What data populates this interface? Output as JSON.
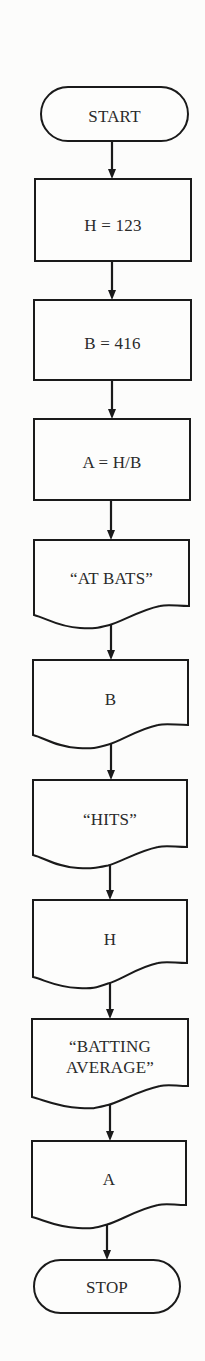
{
  "diagram": {
    "type": "flowchart",
    "direction": "top-to-bottom",
    "colors": {
      "background": "#fcfcfb",
      "stroke": "#1a1a1a",
      "text": "#2a2a2a"
    },
    "nodes": [
      {
        "id": "start",
        "kind": "terminal",
        "label_lines": [
          "START"
        ],
        "box": {
          "x": 41,
          "y": 87,
          "w": 147,
          "h": 54
        },
        "text_y": [
          122
        ]
      },
      {
        "id": "assign-h",
        "kind": "process",
        "label_lines": [
          "H = 123"
        ],
        "box": {
          "x": 35,
          "y": 179,
          "w": 156,
          "h": 82
        },
        "text_y": [
          231
        ]
      },
      {
        "id": "assign-b",
        "kind": "process",
        "label_lines": [
          "B = 416"
        ],
        "box": {
          "x": 34,
          "y": 300,
          "w": 157,
          "h": 80
        },
        "text_y": [
          349
        ]
      },
      {
        "id": "compute-a",
        "kind": "process",
        "label_lines": [
          "A = H/B"
        ],
        "box": {
          "x": 34,
          "y": 419,
          "w": 156,
          "h": 81
        },
        "text_y": [
          468
        ]
      },
      {
        "id": "print-at-bats",
        "kind": "document",
        "label_lines": [
          "“AT BATS”"
        ],
        "box": {
          "x": 34,
          "y": 540,
          "w": 155,
          "h": 0
        },
        "bottom": {
          "left_y": 615,
          "right_y": 606,
          "trough_x": 80,
          "trough_y": 628,
          "peak_x": 160,
          "peak_y": 604
        },
        "text_y": [
          584
        ]
      },
      {
        "id": "print-b",
        "kind": "document",
        "label_lines": [
          "B"
        ],
        "box": {
          "x": 33,
          "y": 660,
          "w": 155,
          "h": 0
        },
        "bottom": {
          "left_y": 735,
          "right_y": 725,
          "trough_x": 78,
          "trough_y": 748,
          "peak_x": 158,
          "peak_y": 723
        },
        "text_y": [
          705
        ]
      },
      {
        "id": "print-hits",
        "kind": "document",
        "label_lines": [
          "“HITS”"
        ],
        "box": {
          "x": 33,
          "y": 780,
          "w": 154,
          "h": 0
        },
        "bottom": {
          "left_y": 855,
          "right_y": 847,
          "trough_x": 78,
          "trough_y": 868,
          "peak_x": 158,
          "peak_y": 845
        },
        "text_y": [
          825
        ]
      },
      {
        "id": "print-h",
        "kind": "document",
        "label_lines": [
          "H"
        ],
        "box": {
          "x": 33,
          "y": 900,
          "w": 154,
          "h": 0
        },
        "bottom": {
          "left_y": 977,
          "right_y": 963,
          "trough_x": 78,
          "trough_y": 988,
          "peak_x": 158,
          "peak_y": 961
        },
        "text_y": [
          945
        ]
      },
      {
        "id": "print-batting-average",
        "kind": "document",
        "label_lines": [
          "“BATTING",
          "AVERAGE”"
        ],
        "box": {
          "x": 32,
          "y": 1019,
          "w": 156,
          "h": 0
        },
        "bottom": {
          "left_y": 1097,
          "right_y": 1086,
          "trough_x": 80,
          "trough_y": 1108,
          "peak_x": 160,
          "peak_y": 1084
        },
        "text_y": [
          1052,
          1073
        ]
      },
      {
        "id": "print-a",
        "kind": "document",
        "label_lines": [
          "A"
        ],
        "box": {
          "x": 32,
          "y": 1141,
          "w": 154,
          "h": 0
        },
        "bottom": {
          "left_y": 1217,
          "right_y": 1205,
          "trough_x": 78,
          "trough_y": 1228,
          "peak_x": 158,
          "peak_y": 1203
        },
        "text_y": [
          1185
        ]
      },
      {
        "id": "stop",
        "kind": "terminal",
        "label_lines": [
          "STOP"
        ],
        "box": {
          "x": 34,
          "y": 1260,
          "w": 146,
          "h": 53
        },
        "text_y": [
          1293
        ]
      }
    ],
    "edges": [
      {
        "from": "start",
        "to": "assign-h",
        "x": 112,
        "y1": 141,
        "y2": 179
      },
      {
        "from": "assign-h",
        "to": "assign-b",
        "x": 112,
        "y1": 261,
        "y2": 300
      },
      {
        "from": "assign-b",
        "to": "compute-a",
        "x": 112,
        "y1": 380,
        "y2": 419
      },
      {
        "from": "compute-a",
        "to": "print-at-bats",
        "x": 111,
        "y1": 500,
        "y2": 540
      },
      {
        "from": "print-at-bats",
        "to": "print-b",
        "x": 111,
        "y1": 622,
        "y2": 660
      },
      {
        "from": "print-b",
        "to": "print-hits",
        "x": 111,
        "y1": 741,
        "y2": 780
      },
      {
        "from": "print-hits",
        "to": "print-h",
        "x": 110,
        "y1": 862,
        "y2": 900
      },
      {
        "from": "print-h",
        "to": "print-batting-average",
        "x": 110,
        "y1": 982,
        "y2": 1019
      },
      {
        "from": "print-batting-average",
        "to": "print-a",
        "x": 110,
        "y1": 1102,
        "y2": 1141
      },
      {
        "from": "print-a",
        "to": "stop",
        "x": 107,
        "y1": 1222,
        "y2": 1260
      }
    ]
  }
}
